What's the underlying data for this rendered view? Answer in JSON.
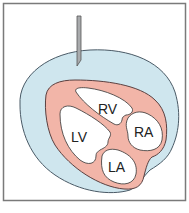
{
  "diagram": {
    "labels": {
      "rv": "RV",
      "ra": "RA",
      "lv": "LV",
      "la": "LA"
    },
    "colors": {
      "frame": "#7a7a7a",
      "pericardial_fluid": "#cfe6ee",
      "pericardial_outline": "#4a5a66",
      "myocardium": "#f2b5a8",
      "myocardium_outline": "#5a4040",
      "chamber": "#ffffff",
      "needle": "#a9abad",
      "needle_outline": "#555555"
    }
  }
}
